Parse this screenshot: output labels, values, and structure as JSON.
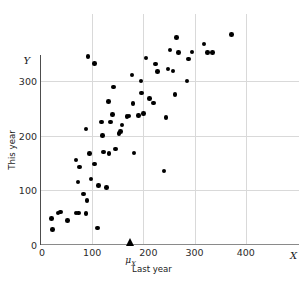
{
  "chart_data": {
    "type": "scatter",
    "title": "",
    "xlabel": "Last year",
    "ylabel": "This year",
    "x_axis_symbol": "X",
    "y_axis_symbol": "Y",
    "xlim": [
      0,
      460
    ],
    "ylim": [
      0,
      390
    ],
    "grid": true,
    "legend": "none",
    "xticks": [
      0,
      100,
      200,
      300,
      400
    ],
    "yticks": [
      0,
      100,
      200,
      300
    ],
    "xtick_labels": [
      "0",
      "100",
      "200",
      "300",
      "400"
    ],
    "ytick_labels": [
      "0",
      "100",
      "200",
      "300"
    ],
    "annotations": [
      {
        "name": "mu-x-marker",
        "label": "μ",
        "subscript": "X",
        "axis": "x",
        "value": 175,
        "marker": "filled-triangle-up"
      }
    ],
    "points": [
      {
        "x": 20,
        "y": 48
      },
      {
        "x": 22,
        "y": 28
      },
      {
        "x": 33,
        "y": 58
      },
      {
        "x": 38,
        "y": 60
      },
      {
        "x": 52,
        "y": 44
      },
      {
        "x": 68,
        "y": 58
      },
      {
        "x": 73,
        "y": 58
      },
      {
        "x": 88,
        "y": 57
      },
      {
        "x": 68,
        "y": 155
      },
      {
        "x": 75,
        "y": 142
      },
      {
        "x": 72,
        "y": 115
      },
      {
        "x": 83,
        "y": 93
      },
      {
        "x": 90,
        "y": 81
      },
      {
        "x": 88,
        "y": 212
      },
      {
        "x": 92,
        "y": 345
      },
      {
        "x": 95,
        "y": 167
      },
      {
        "x": 98,
        "y": 120
      },
      {
        "x": 104,
        "y": 148
      },
      {
        "x": 105,
        "y": 332
      },
      {
        "x": 110,
        "y": 30
      },
      {
        "x": 112,
        "y": 108
      },
      {
        "x": 118,
        "y": 225
      },
      {
        "x": 120,
        "y": 200
      },
      {
        "x": 122,
        "y": 170
      },
      {
        "x": 128,
        "y": 105
      },
      {
        "x": 132,
        "y": 262
      },
      {
        "x": 133,
        "y": 167
      },
      {
        "x": 136,
        "y": 225
      },
      {
        "x": 140,
        "y": 238
      },
      {
        "x": 142,
        "y": 289
      },
      {
        "x": 145,
        "y": 175
      },
      {
        "x": 152,
        "y": 204
      },
      {
        "x": 155,
        "y": 207
      },
      {
        "x": 158,
        "y": 219
      },
      {
        "x": 168,
        "y": 235
      },
      {
        "x": 172,
        "y": 236
      },
      {
        "x": 178,
        "y": 311
      },
      {
        "x": 180,
        "y": 259
      },
      {
        "x": 182,
        "y": 168
      },
      {
        "x": 190,
        "y": 237
      },
      {
        "x": 195,
        "y": 300
      },
      {
        "x": 196,
        "y": 278
      },
      {
        "x": 200,
        "y": 240
      },
      {
        "x": 205,
        "y": 342
      },
      {
        "x": 212,
        "y": 268
      },
      {
        "x": 220,
        "y": 260
      },
      {
        "x": 224,
        "y": 331
      },
      {
        "x": 228,
        "y": 317
      },
      {
        "x": 240,
        "y": 135
      },
      {
        "x": 244,
        "y": 233
      },
      {
        "x": 248,
        "y": 322
      },
      {
        "x": 252,
        "y": 357
      },
      {
        "x": 258,
        "y": 318
      },
      {
        "x": 262,
        "y": 275
      },
      {
        "x": 265,
        "y": 380
      },
      {
        "x": 268,
        "y": 352
      },
      {
        "x": 285,
        "y": 300
      },
      {
        "x": 288,
        "y": 340
      },
      {
        "x": 295,
        "y": 353
      },
      {
        "x": 318,
        "y": 368
      },
      {
        "x": 325,
        "y": 352
      },
      {
        "x": 335,
        "y": 352
      },
      {
        "x": 372,
        "y": 385
      }
    ]
  }
}
